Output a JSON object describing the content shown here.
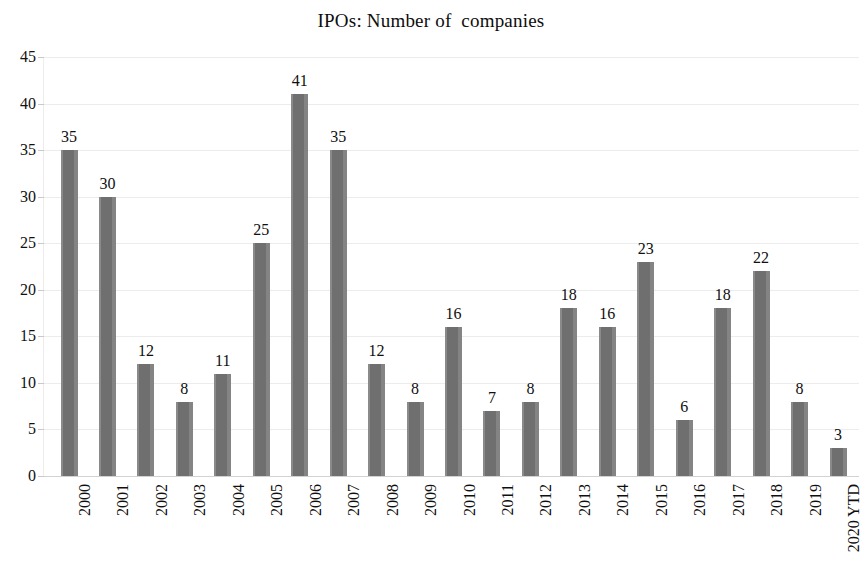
{
  "chart_data": {
    "type": "bar",
    "title": "IPOs: Number of  companies",
    "xlabel": "",
    "ylabel": "",
    "categories": [
      "2000",
      "2001",
      "2002",
      "2003",
      "2004",
      "2005",
      "2006",
      "2007",
      "2008",
      "2009",
      "2010",
      "2011",
      "2012",
      "2013",
      "2014",
      "2015",
      "2016",
      "2017",
      "2018",
      "2019",
      "2020 YTD"
    ],
    "values": [
      35,
      30,
      12,
      8,
      11,
      25,
      41,
      35,
      12,
      8,
      16,
      7,
      8,
      18,
      16,
      23,
      6,
      18,
      22,
      8,
      3
    ],
    "data_labels": [
      "35",
      "30",
      "12",
      "8",
      "11",
      "25",
      "41",
      "35",
      "12",
      "8",
      "16",
      "7",
      "8",
      "18",
      "16",
      "23",
      "6",
      "18",
      "22",
      "8",
      "3"
    ],
    "ylim": [
      0,
      45
    ],
    "ytick_step": 5,
    "yticks": [
      "45",
      "40",
      "35",
      "30",
      "25",
      "20",
      "15",
      "10",
      "5",
      "0"
    ],
    "grid": "horizontal",
    "legend": "none",
    "bar_color": "#787878",
    "gridline_color": "#ececed",
    "text_color": "#0f0f0f",
    "background": "#ffffff"
  }
}
